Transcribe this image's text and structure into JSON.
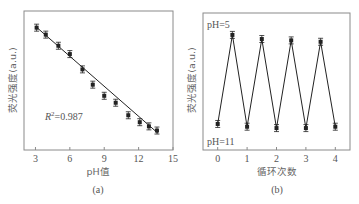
{
  "chart_data": [
    {
      "type": "scatter",
      "panel": "(a)",
      "title": "",
      "xlabel": "pH值",
      "ylabel": "荧光强度(a.u.)",
      "xlim": [
        2,
        15
      ],
      "ylim": [
        0,
        100
      ],
      "xticks": [
        3,
        6,
        9,
        12,
        15
      ],
      "yticks": [],
      "grid": false,
      "annotation": "R²=0.987",
      "r_squared": 0.987,
      "series": [
        {
          "name": "measured",
          "marker": "square",
          "error_bars": true,
          "x": [
            3.1,
            3.9,
            5.0,
            6.0,
            7.1,
            8.0,
            9.0,
            10.0,
            11.1,
            12.1,
            12.9,
            13.6
          ],
          "y": [
            88,
            83,
            75,
            69,
            58,
            47,
            39,
            34,
            25,
            20,
            17,
            14
          ]
        },
        {
          "name": "linear fit",
          "type": "line",
          "x": [
            3.0,
            13.7
          ],
          "y": [
            89,
            12
          ]
        }
      ]
    },
    {
      "type": "line",
      "panel": "(b)",
      "title": "",
      "xlabel": "循环次数",
      "ylabel": "荧光强度(a.u.)",
      "xlim": [
        -0.5,
        4.5
      ],
      "ylim": [
        0,
        100
      ],
      "xticks": [
        0,
        1,
        2,
        3,
        4
      ],
      "yticks": [],
      "grid": false,
      "annotations": [
        "pH=5",
        "pH=11"
      ],
      "series": [
        {
          "name": "cycling",
          "marker": "square",
          "error_bars": true,
          "x": [
            0,
            0.5,
            1,
            1.5,
            2,
            2.5,
            3,
            3.5,
            4
          ],
          "y": [
            19,
            84,
            17,
            81,
            16,
            80,
            16,
            79,
            17
          ]
        }
      ]
    }
  ],
  "panel_a": {
    "xlabel": "pH值",
    "ylabel": "荧光强度(a.u.)",
    "xticks": [
      "3",
      "6",
      "9",
      "12",
      "15"
    ],
    "r2_prefix": "R",
    "r2_sup": "2",
    "r2_value": "=0.987",
    "caption": "(a)"
  },
  "panel_b": {
    "xlabel": "循环次数",
    "ylabel": "荧光强度(a.u.)",
    "xticks": [
      "0",
      "1",
      "2",
      "3",
      "4"
    ],
    "label_high": "pH=5",
    "label_low": "pH=11",
    "caption": "(b)"
  },
  "colors": {
    "axis": "#8a8a8a",
    "data": "#222222",
    "text": "#555555"
  }
}
